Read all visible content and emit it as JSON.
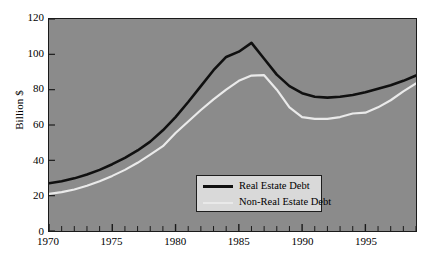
{
  "chart_data": {
    "type": "line",
    "title": "",
    "xlabel": "",
    "ylabel": "Billion $",
    "xlim": [
      1970,
      1999
    ],
    "ylim": [
      0,
      120
    ],
    "grid": false,
    "legend_position": "bottom-center-inside",
    "y_ticks": [
      0,
      20,
      40,
      60,
      80,
      100,
      120
    ],
    "x_ticks": [
      1970,
      1975,
      1980,
      1985,
      1990,
      1995
    ],
    "x_minor_tick_interval": 1,
    "x": [
      1970,
      1971,
      1972,
      1973,
      1974,
      1975,
      1976,
      1977,
      1978,
      1979,
      1980,
      1981,
      1982,
      1983,
      1984,
      1985,
      1986,
      1987,
      1988,
      1989,
      1990,
      1991,
      1992,
      1993,
      1994,
      1995,
      1996,
      1997,
      1998,
      1999
    ],
    "series": [
      {
        "name": "Real Estate Debt",
        "color": "#101010",
        "values": [
          27.0,
          28.2,
          29.8,
          32.0,
          34.6,
          37.8,
          41.4,
          45.6,
          50.6,
          57.0,
          64.5,
          73.0,
          82.0,
          91.0,
          98.5,
          101.5,
          106.5,
          97.5,
          88.5,
          82.0,
          78.0,
          76.0,
          75.5,
          76.0,
          77.0,
          78.5,
          80.5,
          82.5,
          85.0,
          88.0
        ]
      },
      {
        "name": "Non-Real Estate Debt",
        "color": "#eaeaea",
        "values": [
          21.0,
          22.0,
          23.5,
          25.6,
          28.2,
          31.2,
          34.6,
          38.6,
          43.2,
          48.0,
          55.5,
          62.0,
          68.5,
          74.5,
          80.0,
          85.0,
          88.0,
          88.2,
          80.0,
          70.0,
          64.5,
          63.5,
          63.5,
          64.5,
          66.5,
          67.0,
          70.0,
          74.0,
          79.0,
          83.5
        ]
      }
    ],
    "y_tick_labels": [
      "0",
      "20",
      "40",
      "60",
      "80",
      "100",
      "120"
    ],
    "x_tick_labels": [
      "1970",
      "1975",
      "1980",
      "1985",
      "1990",
      "1995"
    ]
  },
  "legend": {
    "items": [
      {
        "label": "Real Estate Debt"
      },
      {
        "label": "Non-Real Estate Debt"
      }
    ]
  },
  "colors": {
    "plot_background": "#8b8b8b",
    "page_background": "#ffffff",
    "axis": "#1a1a1a",
    "legend_background": "#d9d9d9",
    "real_estate_debt": "#101010",
    "non_real_estate_debt": "#eaeaea"
  }
}
